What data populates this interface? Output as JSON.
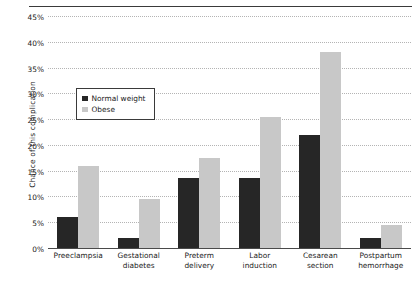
{
  "chart_data": {
    "type": "bar",
    "title": "",
    "subtitle": "",
    "xlabel": "",
    "ylabel": "Chance of this complication",
    "ylim": [
      0,
      45
    ],
    "ytick_labels": [
      "45%",
      "40%",
      "35%",
      "30%",
      "25%",
      "20%",
      "15%",
      "10%",
      "5%",
      "0%"
    ],
    "ytick_values": [
      45,
      40,
      35,
      30,
      25,
      20,
      15,
      10,
      5,
      0
    ],
    "grid": true,
    "grid_style": "dotted-horizontal",
    "legend_position": "inside-upper-left",
    "categories": [
      "Preeclampsia",
      "Gestational diabetes",
      "Preterm delivery",
      "Labor induction",
      "Cesarean section",
      "Postpartum hemorrhage"
    ],
    "series": [
      {
        "name": "Normal weight",
        "color": "#262626",
        "values": [
          6,
          2,
          13.5,
          13.5,
          22,
          2
        ]
      },
      {
        "name": "Obese",
        "color": "#c8c8c8",
        "values": [
          16,
          9.5,
          17.5,
          25.5,
          38,
          4.5
        ]
      }
    ]
  },
  "axis": {
    "y_title": "Chance of this complication",
    "ticks": [
      {
        "label": "45%",
        "value": 45
      },
      {
        "label": "40%",
        "value": 40
      },
      {
        "label": "35%",
        "value": 35
      },
      {
        "label": "30%",
        "value": 30
      },
      {
        "label": "25%",
        "value": 25
      },
      {
        "label": "20%",
        "value": 20
      },
      {
        "label": "15%",
        "value": 15
      },
      {
        "label": "10%",
        "value": 10
      },
      {
        "label": "5%",
        "value": 5
      },
      {
        "label": "0%",
        "value": 0
      }
    ],
    "categories": [
      {
        "line1": "Preeclampsia",
        "line2": ""
      },
      {
        "line1": "Gestational",
        "line2": "diabetes"
      },
      {
        "line1": "Preterm",
        "line2": "delivery"
      },
      {
        "line1": "Labor",
        "line2": "induction"
      },
      {
        "line1": "Cesarean",
        "line2": "section"
      },
      {
        "line1": "Postpartum",
        "line2": "hemorrhage"
      }
    ]
  },
  "legend": {
    "items": [
      {
        "label": "Normal weight",
        "color": "#262626"
      },
      {
        "label": "Obese",
        "color": "#c8c8c8"
      }
    ]
  },
  "colors": {
    "normal_weight": "#262626",
    "obese": "#c8c8c8",
    "gridline": "#b4b4b4",
    "axis": "#4a4a4a",
    "background": "#ffffff"
  }
}
